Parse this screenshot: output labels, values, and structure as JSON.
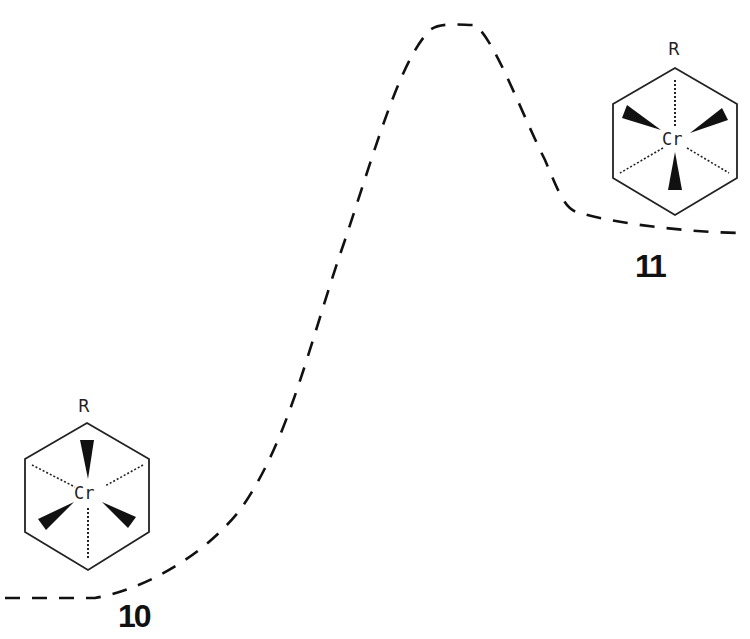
{
  "diagram": {
    "type": "reaction-energy-profile",
    "line_style": "dashed",
    "line_color": "#111111",
    "reactant": {
      "compound_number": "10",
      "substituent_label": "R",
      "metal_label": "Cr",
      "conformation": "eclipsed"
    },
    "product": {
      "compound_number": "11",
      "substituent_label": "R",
      "metal_label": "Cr",
      "conformation": "staggered"
    },
    "curve_points_desc": [
      "reactant plateau (low, left)",
      "transition state maximum (top center)",
      "product plateau (higher, right)"
    ]
  }
}
